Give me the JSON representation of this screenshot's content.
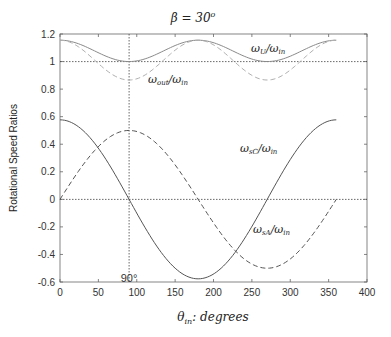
{
  "chart_data": {
    "type": "line",
    "xlabel": "θ_in: degrees",
    "ylabel": "Rotational Speed Ratios",
    "xlim": [
      0,
      400
    ],
    "ylim": [
      -0.6,
      1.2
    ],
    "xticks": [
      0,
      50,
      100,
      150,
      200,
      250,
      300,
      350,
      400
    ],
    "yticks": [
      -0.6,
      -0.4,
      -0.2,
      0,
      0.2,
      0.4,
      0.6,
      0.8,
      1,
      1.2
    ],
    "ytick_labels": [
      "-0.6",
      "-0.4",
      "-0.2",
      "0",
      "0.2",
      "0.4",
      "0.6",
      "0.8",
      "1",
      "1.2"
    ],
    "grid": false,
    "reference_lines": [
      {
        "type": "horizontal",
        "y": 1,
        "style": "dotted"
      },
      {
        "type": "horizontal",
        "y": 0,
        "style": "dotted"
      },
      {
        "type": "vertical",
        "x": 90,
        "style": "dotted",
        "label": "90°"
      }
    ],
    "series": [
      {
        "name": "ω_U/ω_in",
        "style": "solid",
        "color": "#888888",
        "x": [
          0,
          45,
          90,
          135,
          180,
          225,
          270,
          315,
          360
        ],
        "values": [
          1.155,
          1.07,
          1.0,
          1.07,
          1.155,
          1.07,
          1.0,
          1.07,
          1.155
        ]
      },
      {
        "name": "ω_out/ω_in",
        "style": "dashed",
        "color": "#aaaaaa",
        "x": [
          0,
          45,
          90,
          135,
          180,
          225,
          270,
          315,
          360
        ],
        "values": [
          1.155,
          1.0,
          0.866,
          1.0,
          1.155,
          1.0,
          0.866,
          1.0,
          1.155
        ]
      },
      {
        "name": "ω_sC/ω_in",
        "style": "dashed",
        "color": "#555555",
        "x": [
          0,
          45,
          90,
          135,
          180,
          225,
          270,
          315,
          360
        ],
        "values": [
          0,
          -0.35,
          -0.5,
          -0.35,
          0,
          0.35,
          0.5,
          0.35,
          0
        ]
      },
      {
        "name": "ω_sA/ω_in",
        "style": "solid",
        "color": "#555555",
        "x": [
          0,
          45,
          90,
          135,
          180,
          225,
          270,
          315,
          360
        ],
        "values": [
          0.577,
          0.41,
          0,
          -0.41,
          -0.577,
          -0.41,
          0,
          0.41,
          0.577
        ]
      }
    ],
    "annotations": [
      {
        "text": "ω_U/ω_in",
        "x": 265,
        "y": 1.13
      },
      {
        "text": "ω_out/ω_in",
        "x": 145,
        "y": 0.92
      },
      {
        "text": "ω_sC/ω_in",
        "x": 230,
        "y": 0.39
      },
      {
        "text": "ω_sA/ω_in",
        "x": 255,
        "y": -0.29
      },
      {
        "text": "90°",
        "x": 90,
        "y": -0.57
      }
    ]
  },
  "labels": {
    "title_main": "β = 30",
    "title_sup": "o",
    "ylabel": "Rotational Speed Ratios",
    "xlabel_theta": "θ",
    "xlabel_sub": "in",
    "xlabel_rest": ": degrees",
    "marker_90": "90°",
    "ann_U_w": "ω",
    "ann_U_sub": "U",
    "ann_U_rest": "/ω",
    "ann_U_sub2": "in",
    "ann_out_w": "ω",
    "ann_out_sub": "out",
    "ann_out_rest": "/ω",
    "ann_out_sub2": "in",
    "ann_sC_w": "ω",
    "ann_sC_sub": "sC",
    "ann_sC_rest": "/ω",
    "ann_sC_sub2": "in",
    "ann_sA_w": "ω",
    "ann_sA_sub": "sA",
    "ann_sA_rest": "/ω",
    "ann_sA_sub2": "in"
  },
  "xtick_labels": [
    "0",
    "50",
    "100",
    "150",
    "200",
    "250",
    "300",
    "350",
    "400"
  ]
}
